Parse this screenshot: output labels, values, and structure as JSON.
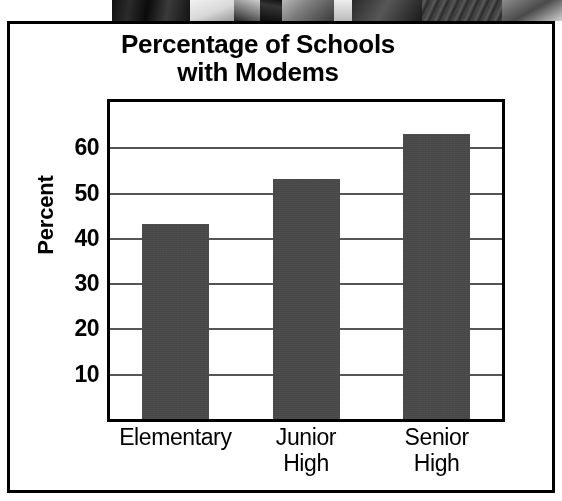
{
  "figure": {
    "frame_color": "#000000",
    "background": "#ffffff",
    "photo_strip_alt": "grayscale-photo-strip"
  },
  "chart_data": {
    "type": "bar",
    "title": "Percentage of Schools\nwith Modems",
    "title_line1": "Percentage of Schools",
    "title_line2": "with Modems",
    "xlabel": "",
    "ylabel": "Percent",
    "categories": [
      "Elementary",
      "Junior\nHigh",
      "Senior\nHigh"
    ],
    "category_labels": [
      {
        "line1": "Elementary",
        "line2": ""
      },
      {
        "line1": "Junior",
        "line2": "High"
      },
      {
        "line1": "Senior",
        "line2": "High"
      }
    ],
    "values": [
      43,
      53,
      63
    ],
    "ylim": [
      0,
      70
    ],
    "yticks": [
      10,
      20,
      30,
      40,
      50,
      60
    ],
    "ytick_labels": [
      "10",
      "20",
      "30",
      "40",
      "50",
      "60"
    ],
    "grid": true,
    "grid_axis": "y",
    "legend": null,
    "bar_color": "#474747",
    "gridline_color": "#555555",
    "axis_color": "#000000"
  }
}
